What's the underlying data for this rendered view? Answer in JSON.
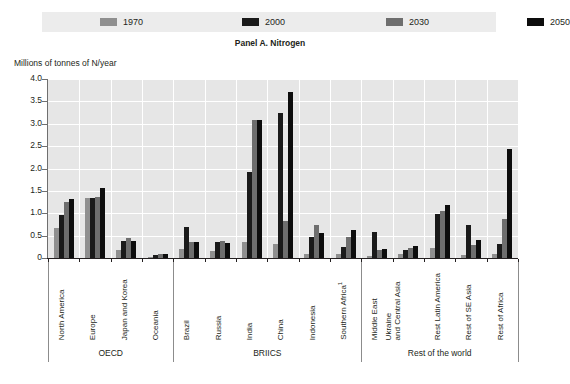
{
  "panel_title": "Panel A. Nitrogen",
  "yaxis_title": "Millions of tonnes of N/year",
  "legend": [
    {
      "label": "1970",
      "color": "#8f8f8f"
    },
    {
      "label": "2000",
      "color": "#1a1a1a"
    },
    {
      "label": "2030",
      "color": "#6e6e6e"
    },
    {
      "label": "2050",
      "color": "#0d0d0d"
    }
  ],
  "groups": [
    {
      "label": "OECD",
      "count": 4
    },
    {
      "label": "BRIICS",
      "count": 6
    },
    {
      "label": "Rest of the world",
      "count": 5
    }
  ],
  "ytick_labels": [
    "4.0",
    "3.5",
    "3.0",
    "2.5",
    "2.0",
    "1.5",
    "1.0",
    "0.5",
    "0"
  ],
  "chart_data": {
    "type": "bar",
    "title": "Panel A. Nitrogen",
    "xlabel": "",
    "ylabel": "Millions of tonnes of N/year",
    "ylim": [
      0,
      4.0
    ],
    "ytick_step": 0.5,
    "grid": true,
    "legend_position": "top",
    "categories": [
      "North America",
      "Europe",
      "Japan and Korea",
      "Oceania",
      "Brazil",
      "Russia",
      "India",
      "China",
      "Indonesia",
      "Southern Africa¹",
      "Middle East",
      "Ukraine and Central Asia",
      "Rest Latin America",
      "Rest of SE Asia",
      "Rest of Africa"
    ],
    "category_groups": [
      "OECD",
      "OECD",
      "OECD",
      "OECD",
      "BRIICS",
      "BRIICS",
      "BRIICS",
      "BRIICS",
      "BRIICS",
      "BRIICS",
      "Rest of the world",
      "Rest of the world",
      "Rest of the world",
      "Rest of the world",
      "Rest of the world"
    ],
    "series": [
      {
        "name": "1970",
        "color": "#8f8f8f",
        "values": [
          0.67,
          1.35,
          0.18,
          0.03,
          0.21,
          0.16,
          0.35,
          0.32,
          0.1,
          0.08,
          0.05,
          0.08,
          0.22,
          0.06,
          0.09
        ]
      },
      {
        "name": "2000",
        "color": "#1a1a1a",
        "values": [
          0.96,
          1.33,
          0.39,
          0.06,
          0.69,
          0.36,
          1.92,
          3.24,
          0.48,
          0.24,
          0.58,
          0.19,
          0.98,
          0.73,
          0.32
        ]
      },
      {
        "name": "2030",
        "color": "#6e6e6e",
        "values": [
          1.26,
          1.36,
          0.44,
          0.08,
          0.35,
          0.38,
          3.08,
          0.83,
          0.74,
          0.46,
          0.18,
          0.22,
          1.04,
          0.3,
          0.88
        ]
      },
      {
        "name": "2050",
        "color": "#0d0d0d",
        "values": [
          1.32,
          1.57,
          0.37,
          0.09,
          0.36,
          0.33,
          3.08,
          3.71,
          0.57,
          0.62,
          0.21,
          0.26,
          1.19,
          0.41,
          2.44
        ]
      }
    ]
  }
}
